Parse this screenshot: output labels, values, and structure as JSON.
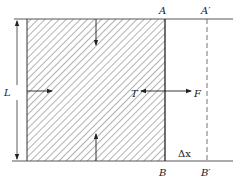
{
  "diagram": {
    "type": "surface-film-work-diagram",
    "labels": {
      "A": "A",
      "A_prime": "A′",
      "B": "B",
      "B_prime": "B′",
      "L": "L",
      "T": "T",
      "F": "F",
      "delta_x": "Δx"
    },
    "colors": {
      "line": "#333333",
      "hatch": "#555555",
      "dashed": "#666666",
      "background": "#ffffff"
    },
    "elements": [
      {
        "id": "hatched-film",
        "desc": "hatched rectangular film region bounded on right by AB"
      },
      {
        "id": "top-line",
        "desc": "horizontal frame line through A and A′"
      },
      {
        "id": "bottom-line",
        "desc": "horizontal frame line through B and B′"
      },
      {
        "id": "movable-wire",
        "desc": "bold vertical edge AB"
      },
      {
        "id": "displaced-wire",
        "desc": "dashed vertical line A′B′"
      },
      {
        "id": "dimension-L",
        "desc": "double-headed vertical dimension arrow labelled L"
      },
      {
        "id": "force-arrows",
        "desc": "tension T pointing into film, external force F pointing right, plus inner arrows from top, bottom and left edges"
      }
    ]
  }
}
